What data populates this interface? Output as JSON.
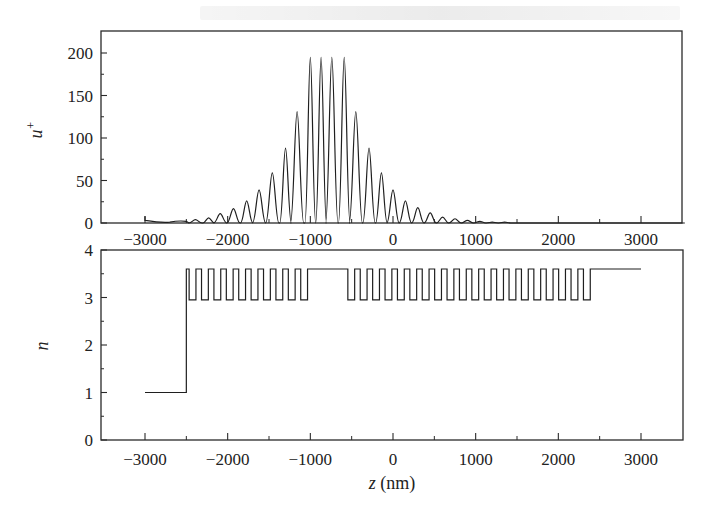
{
  "chart_data": [
    {
      "type": "line",
      "panel": "top",
      "title": "",
      "xlabel": "",
      "ylabel": "u+",
      "ylabel_main": "u",
      "ylabel_sup": "+",
      "xlim": [
        -3530,
        3530
      ],
      "ylim": [
        0,
        225
      ],
      "xticks": [
        -3000,
        -2000,
        -1000,
        0,
        1000,
        2000,
        3000
      ],
      "xtick_labels": [
        "−3000",
        "−2000",
        "−1000",
        "0",
        "1000",
        "2000",
        "3000"
      ],
      "yticks": [
        0,
        50,
        100,
        150,
        200
      ],
      "ytick_labels": [
        "0",
        "50",
        "100",
        "150",
        "200"
      ],
      "grid": false,
      "legend": null,
      "description": "Field enhancement profile: oscillating peaks with envelope maximum near z = -750 nm; four central peaks reach ~195",
      "peaks": {
        "z": [
          -2390,
          -2230,
          -2090,
          -1930,
          -1770,
          -1620,
          -1460,
          -1300,
          -1160,
          -1000,
          -870,
          -740,
          -590,
          -450,
          -290,
          -140,
          0,
          150,
          300,
          450,
          600,
          750,
          900,
          1050,
          1200,
          1350,
          1500
        ],
        "values": [
          4,
          6,
          11,
          17,
          26,
          39,
          59,
          88,
          131,
          195,
          195,
          195,
          195,
          131,
          88,
          59,
          39,
          26,
          18,
          12,
          7,
          5,
          3,
          2,
          1,
          1,
          0
        ]
      }
    },
    {
      "type": "line",
      "panel": "bottom",
      "title": "",
      "xlabel": "z (nm)",
      "xlabel_var": "z",
      "xlabel_unit": " (nm)",
      "ylabel": "n",
      "xlim": [
        -3530,
        3530
      ],
      "ylim": [
        0,
        4
      ],
      "xticks": [
        -3000,
        -2000,
        -1000,
        0,
        1000,
        2000,
        3000
      ],
      "xtick_labels": [
        "−3000",
        "−2000",
        "−1000",
        "0",
        "1000",
        "2000",
        "3000"
      ],
      "yticks": [
        0,
        1,
        2,
        3,
        4
      ],
      "ytick_labels": [
        "0",
        "1",
        "2",
        "3",
        "4"
      ],
      "grid": false,
      "legend": null,
      "description": "Refractive index profile: n=1 for z<-2500, then Bragg grating alternating between n~3.6 and n~2.95 with a defect (high-index) layer near -950 to -580 nm, then second grating to ~2430 nm, then n~3.6 to 3000 nm",
      "segments": [
        {
          "z_start": -3000,
          "z_end": -2500,
          "n": 1.0,
          "label": "incidence medium"
        },
        {
          "z_start": -2500,
          "z_end": -960,
          "n_high": 3.6,
          "n_low": 2.95,
          "period_nm": 150,
          "label": "left Bragg grating"
        },
        {
          "z_start": -960,
          "z_end": -580,
          "n": 3.6,
          "label": "defect layer"
        },
        {
          "z_start": -580,
          "z_end": 2430,
          "n_high": 3.6,
          "n_low": 2.95,
          "period_nm": 150,
          "label": "right Bragg grating"
        },
        {
          "z_start": 2430,
          "z_end": 3000,
          "n": 3.6,
          "label": "substrate"
        }
      ]
    }
  ],
  "colors": {
    "line": "#1f1f1f",
    "frame": "#2a2a2a",
    "background": "#ffffff"
  }
}
